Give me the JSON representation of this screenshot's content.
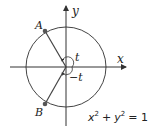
{
  "diagram": {
    "axes": {
      "x_label": "x",
      "y_label": "y"
    },
    "points": [
      {
        "name": "A",
        "label": "A"
      },
      {
        "name": "B",
        "label": "B"
      }
    ],
    "angles": {
      "upper": "t",
      "lower": "−t"
    },
    "equation": {
      "base_x": "x",
      "exp_x": "2",
      "plus": "+",
      "base_y": "y",
      "exp_y": "2",
      "rhs": "= 1"
    },
    "colors": {
      "stroke": "#333333",
      "point": "#555555",
      "background": "#ffffff"
    }
  }
}
